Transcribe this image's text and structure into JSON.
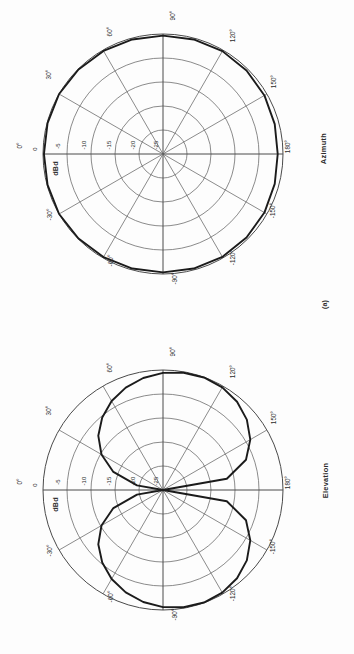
{
  "figure": {
    "caption": "(a)",
    "orientation_deg": -90
  },
  "plots": [
    {
      "id": "azimuth",
      "name": "Azimuth",
      "radial_unit": "dBd",
      "radial_ticks": [
        "0",
        "-5",
        "-10",
        "-15",
        "-20",
        "-25"
      ],
      "angle_ticks": [
        "0°",
        "30°",
        "60°",
        "90°",
        "120°",
        "150°",
        "180°",
        "-150°",
        "-120°",
        "-90°",
        "-60°",
        "-30°"
      ]
    },
    {
      "id": "elevation",
      "name": "Elevation",
      "radial_unit": "dBd",
      "radial_ticks": [
        "0",
        "-5",
        "-10",
        "-15",
        "-20",
        "-25"
      ],
      "angle_ticks": [
        "0°",
        "30°",
        "60°",
        "90°",
        "120°",
        "150°",
        "180°",
        "-150°",
        "-120°",
        "-90°",
        "-60°",
        "-30°"
      ]
    }
  ],
  "colors": {
    "pattern": "#1b1b1b",
    "grid": "#6d6d6d",
    "axis": "#4a4a4a",
    "background": "#fdfdfd",
    "text": "#2b2b2b"
  },
  "chart_data": [
    {
      "type": "line",
      "subtype": "polar",
      "id": "azimuth",
      "title": "Azimuth",
      "xlabel": "Azimuth angle (degrees)",
      "ylabel": "dBd",
      "rlim": [
        -25,
        0
      ],
      "rticks": [
        0,
        -5,
        -10,
        -15,
        -20,
        -25
      ],
      "thetaticks": [
        0,
        30,
        60,
        90,
        120,
        150,
        180,
        -150,
        -120,
        -90,
        -60,
        -30
      ],
      "grid": true,
      "legend": "none",
      "theta": [
        0,
        15,
        30,
        45,
        60,
        75,
        90,
        105,
        120,
        135,
        150,
        165,
        180,
        195,
        210,
        225,
        240,
        255,
        270,
        285,
        300,
        315,
        330,
        345,
        360
      ],
      "values_dBd": [
        -0.2,
        -0.1,
        0.0,
        -0.1,
        -0.2,
        -0.3,
        -0.35,
        -0.3,
        -0.25,
        -0.4,
        -0.6,
        -0.9,
        -1.1,
        -0.9,
        -0.6,
        -0.4,
        -0.25,
        -0.3,
        -0.35,
        -0.3,
        -0.2,
        -0.1,
        0.0,
        -0.1,
        -0.2
      ],
      "annotation": "Near-omnidirectional azimuth pattern, ripple under 1.5 dB"
    },
    {
      "type": "line",
      "subtype": "polar",
      "id": "elevation",
      "title": "Elevation",
      "xlabel": "Elevation angle (degrees)",
      "ylabel": "dBd",
      "rlim": [
        -25,
        0
      ],
      "rticks": [
        0,
        -5,
        -10,
        -15,
        -20,
        -25
      ],
      "thetaticks": [
        0,
        30,
        60,
        90,
        120,
        150,
        180,
        -150,
        -120,
        -90,
        -60,
        -30
      ],
      "grid": true,
      "legend": "none",
      "theta": [
        0,
        10,
        20,
        30,
        40,
        50,
        60,
        70,
        80,
        90,
        100,
        110,
        120,
        130,
        140,
        150,
        160,
        170,
        180,
        190,
        200,
        210,
        220,
        230,
        240,
        250,
        260,
        270,
        280,
        290,
        300,
        310,
        320,
        330,
        340,
        350,
        360
      ],
      "values_dBd": [
        -25,
        -19.5,
        -14.0,
        -10.2,
        -7.4,
        -5.3,
        -3.6,
        -2.3,
        -1.3,
        -0.6,
        -0.2,
        -0.05,
        -0.3,
        -1.0,
        -2.2,
        -4.0,
        -6.6,
        -11.5,
        -25,
        -11.5,
        -6.6,
        -4.0,
        -2.2,
        -1.0,
        -0.3,
        -0.05,
        -0.2,
        -0.6,
        -1.3,
        -2.3,
        -3.6,
        -5.3,
        -7.4,
        -10.2,
        -14.0,
        -19.5,
        -25
      ],
      "annotation": "Figure-eight (dipole-like) elevation pattern with nulls near 0° and 180° and peaks near ±105° / ±75°"
    }
  ]
}
